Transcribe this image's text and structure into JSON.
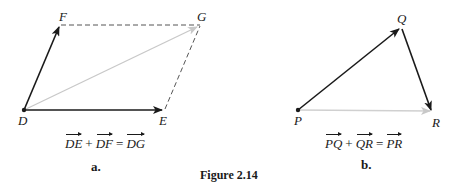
{
  "figure": {
    "caption": "Figure 2.14"
  },
  "panel_a": {
    "sublabel": "a.",
    "points": {
      "D": {
        "label": "D",
        "x": 24,
        "y": 110
      },
      "E": {
        "label": "E",
        "x": 163,
        "y": 110
      },
      "F": {
        "label": "F",
        "x": 60,
        "y": 25
      },
      "G": {
        "label": "G",
        "x": 200,
        "y": 25
      }
    },
    "vectors": [
      {
        "from": "D",
        "to": "E",
        "style": "solid",
        "color": "#1a1a1a"
      },
      {
        "from": "D",
        "to": "F",
        "style": "solid",
        "color": "#1a1a1a"
      },
      {
        "from": "D",
        "to": "G",
        "style": "solid",
        "color": "#c8c8c8"
      }
    ],
    "dashed_sides": [
      {
        "from": "F",
        "to": "G"
      },
      {
        "from": "E",
        "to": "G"
      }
    ],
    "equation": {
      "term1": "DE",
      "plus": "+",
      "term2": "DF",
      "equals": "=",
      "result": "DG"
    }
  },
  "panel_b": {
    "sublabel": "b.",
    "points": {
      "P": {
        "label": "P",
        "x": 298,
        "y": 110
      },
      "Q": {
        "label": "Q",
        "x": 402,
        "y": 28
      },
      "R": {
        "label": "R",
        "x": 432,
        "y": 112
      }
    },
    "vectors": [
      {
        "from": "P",
        "to": "Q",
        "style": "solid",
        "color": "#1a1a1a"
      },
      {
        "from": "Q",
        "to": "R",
        "style": "solid",
        "color": "#1a1a1a"
      },
      {
        "from": "P",
        "to": "R",
        "style": "solid",
        "color": "#d0d0d0"
      }
    ],
    "equation": {
      "term1": "PQ",
      "plus": "+",
      "term2": "QR",
      "equals": "=",
      "result": "PR"
    }
  },
  "colors": {
    "ink": "#1a1a1a",
    "resultant": "#c8c8c8",
    "background": "#ffffff"
  }
}
